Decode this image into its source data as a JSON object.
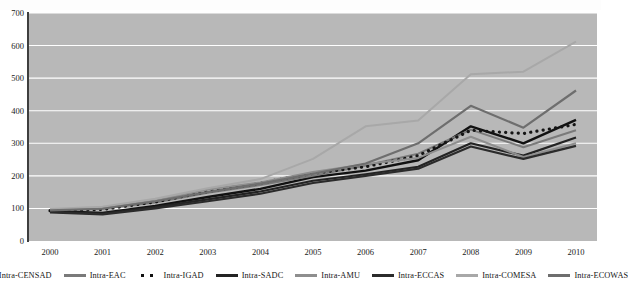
{
  "chart_data": {
    "type": "line",
    "title": "",
    "xlabel": "",
    "ylabel": "",
    "x": [
      "2000",
      "2001",
      "2002",
      "2003",
      "2004",
      "2005",
      "2006",
      "2007",
      "2008",
      "2009",
      "2010"
    ],
    "categories": [
      "2000",
      "2001",
      "2002",
      "2003",
      "2004",
      "2005",
      "2006",
      "2007",
      "2008",
      "2009",
      "2010"
    ],
    "ylim": [
      0,
      700
    ],
    "yticks": [
      0,
      100,
      200,
      300,
      400,
      500,
      600,
      700
    ],
    "grid": true,
    "legend_position": "bottom",
    "plot_background": "#b8b8b8",
    "series": [
      {
        "name": "Intra-CENSAD",
        "color": "#111111",
        "style": "solid",
        "width": 2.4,
        "values": [
          92,
          86,
          108,
          135,
          160,
          196,
          216,
          248,
          352,
          300,
          372
        ]
      },
      {
        "name": "Intra-EAC",
        "color": "#7a7a7a",
        "style": "solid",
        "width": 2.0,
        "values": [
          95,
          100,
          118,
          148,
          172,
          200,
          232,
          268,
          342,
          288,
          340
        ]
      },
      {
        "name": "Intra-IGAD",
        "color": "#151515",
        "style": "dotted",
        "width": 2.6,
        "values": [
          93,
          97,
          120,
          152,
          178,
          208,
          228,
          262,
          340,
          330,
          358
        ]
      },
      {
        "name": "Intra-SADC",
        "color": "#232323",
        "style": "solid",
        "width": 2.2,
        "values": [
          90,
          84,
          104,
          128,
          152,
          185,
          205,
          228,
          300,
          262,
          318
        ]
      },
      {
        "name": "Intra-AMU",
        "color": "#8e8e8e",
        "style": "solid",
        "width": 2.0,
        "values": [
          96,
          102,
          124,
          158,
          180,
          212,
          236,
          255,
          320,
          258,
          300
        ]
      },
      {
        "name": "Intra-ECCAS",
        "color": "#2b2b2b",
        "style": "solid",
        "width": 2.2,
        "values": [
          88,
          82,
          100,
          122,
          145,
          178,
          200,
          222,
          290,
          252,
          292
        ]
      },
      {
        "name": "Intra-COMESA",
        "color": "#a8a8a8",
        "style": "solid",
        "width": 2.0,
        "values": [
          98,
          105,
          130,
          162,
          190,
          252,
          352,
          370,
          512,
          520,
          612
        ]
      },
      {
        "name": "Intra-ECOWAS",
        "color": "#6e6e6e",
        "style": "solid",
        "width": 2.2,
        "values": [
          94,
          99,
          122,
          150,
          176,
          206,
          238,
          300,
          415,
          348,
          462
        ]
      }
    ]
  },
  "axes": {
    "y_labels": [
      "700",
      "600",
      "500",
      "400",
      "300",
      "200",
      "100",
      "0"
    ],
    "x_labels": [
      "2000",
      "2001",
      "2002",
      "2003",
      "2004",
      "2005",
      "2006",
      "2007",
      "2008",
      "2009",
      "2010"
    ]
  },
  "legend": {
    "items": [
      {
        "label": "Intra-CENSAD",
        "swatch": "line-swatch-censad"
      },
      {
        "label": "Intra-EAC",
        "swatch": "line-swatch-eac"
      },
      {
        "label": "Intra-IGAD",
        "swatch": "line-swatch-igad"
      },
      {
        "label": "Intra-SADC",
        "swatch": "line-swatch-sadc"
      },
      {
        "label": "Intra-AMU",
        "swatch": "line-swatch-amu"
      },
      {
        "label": "Intra-ECCAS",
        "swatch": "line-swatch-eccas"
      },
      {
        "label": "Intra-COMESA",
        "swatch": "line-swatch-comesa"
      },
      {
        "label": "Intra-ECOWAS",
        "swatch": "line-swatch-ecowas"
      }
    ]
  }
}
